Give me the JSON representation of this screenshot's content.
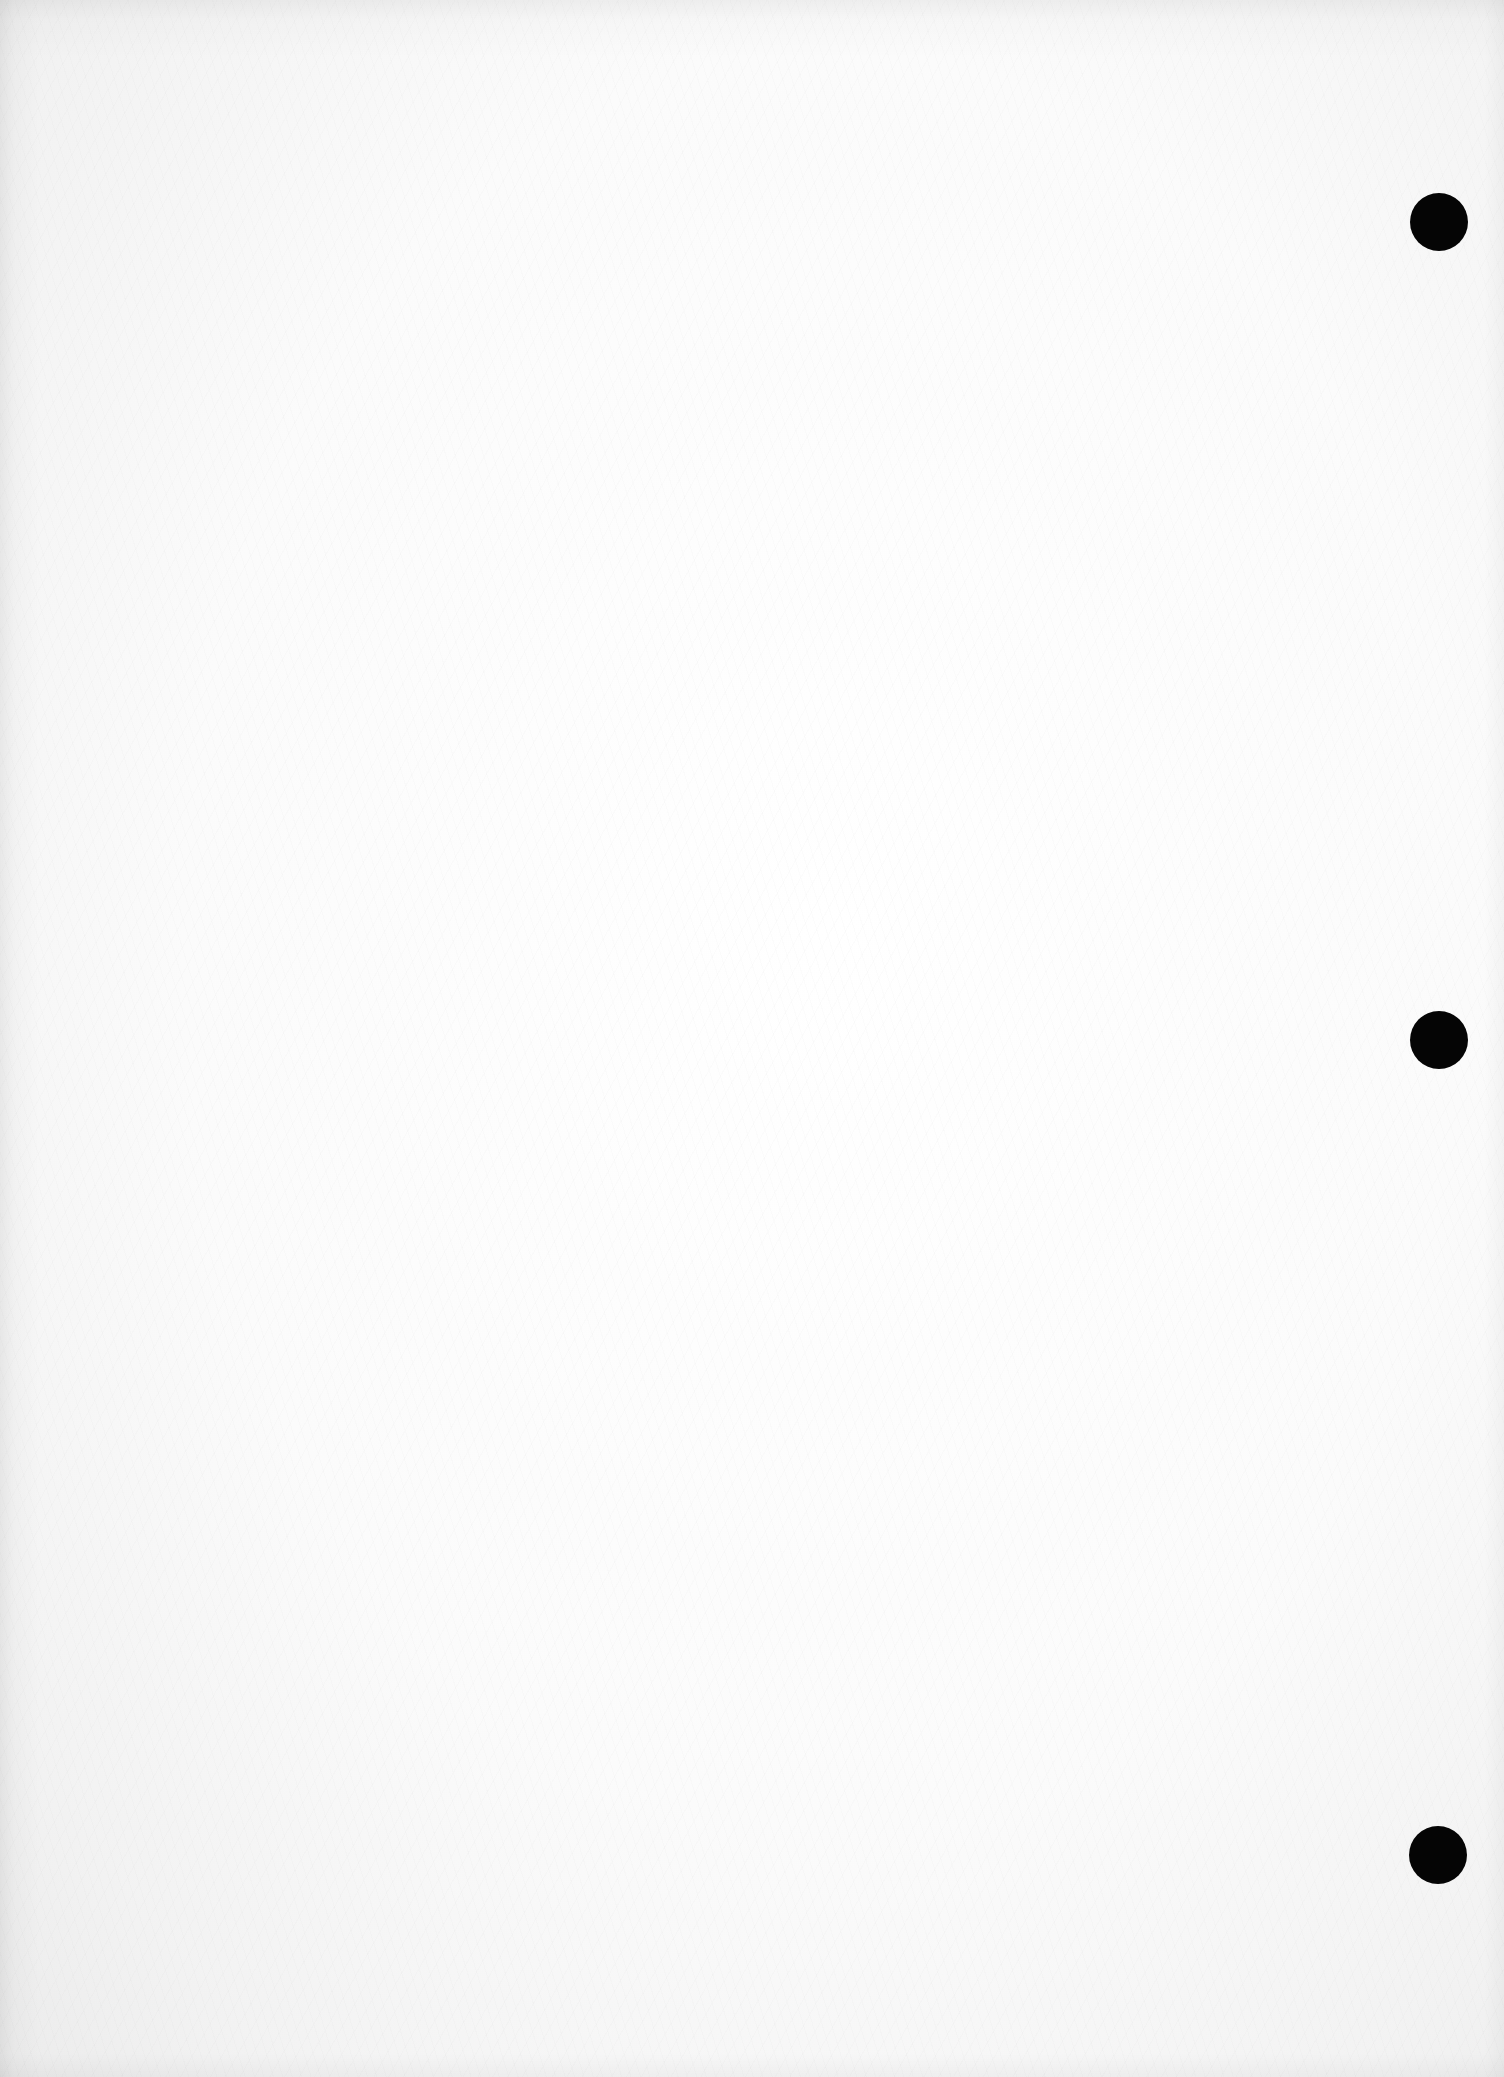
{
  "document": {
    "type": "scanned blank page",
    "text_content": "",
    "paper_color": "#fafafa",
    "punch_holes": [
      {
        "cx": 1439,
        "cy": 222,
        "r": 29,
        "color": "#050505"
      },
      {
        "cx": 1439,
        "cy": 1040,
        "r": 29,
        "color": "#050505"
      },
      {
        "cx": 1438,
        "cy": 1855,
        "r": 29,
        "color": "#050505"
      }
    ]
  }
}
